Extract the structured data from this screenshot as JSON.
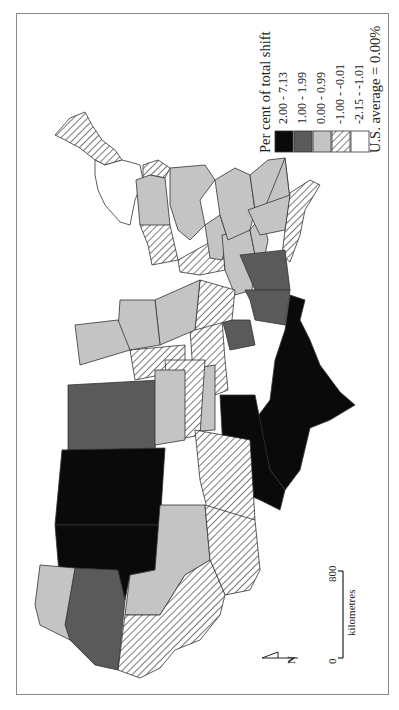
{
  "map": {
    "title": "Per cent of total shift",
    "orientation": "rotated 90 degrees; north arrow points left",
    "legend": {
      "title": "Per cent of total shift",
      "items": [
        {
          "label": "2.00 - 7.13",
          "fill": "#0a0a0a",
          "pattern": "solid"
        },
        {
          "label": "1.00 - 1.99",
          "fill": "#5a5a5a",
          "pattern": "solid"
        },
        {
          "label": "0.00 - 0.99",
          "fill": "#c4c4c4",
          "pattern": "solid"
        },
        {
          "label": "-1.00 - -0.01",
          "fill": "#ffffff",
          "pattern": "hatched"
        },
        {
          "label": "-2.15 - -1.01",
          "fill": "#ffffff",
          "pattern": "solid"
        }
      ]
    },
    "note": "U.S. average = 0.00%",
    "scale": {
      "start": "0",
      "end": "800",
      "unit": "kilometres"
    },
    "north_label": "N",
    "colors": {
      "class1": "#0a0a0a",
      "class2": "#5a5a5a",
      "class3": "#c4c4c4",
      "hatch": "#333333",
      "outline": "#333333",
      "frame": "#888888"
    }
  }
}
